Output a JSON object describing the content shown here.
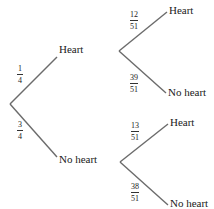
{
  "diagram": {
    "type": "probability-tree",
    "stage1": {
      "branches": [
        {
          "outcome": "Heart",
          "probability": {
            "num": "1",
            "den": "4"
          }
        },
        {
          "outcome": "No heart",
          "probability": {
            "num": "3",
            "den": "4"
          }
        }
      ]
    },
    "stage2": {
      "after_heart": [
        {
          "outcome": "Heart",
          "probability": {
            "num": "12",
            "den": "51"
          }
        },
        {
          "outcome": "No heart",
          "probability": {
            "num": "39",
            "den": "51"
          }
        }
      ],
      "after_no_heart": [
        {
          "outcome": "Heart",
          "probability": {
            "num": "13",
            "den": "51"
          }
        },
        {
          "outcome": "No heart",
          "probability": {
            "num": "38",
            "den": "51"
          }
        }
      ]
    },
    "line_color": "#6b6b6b"
  }
}
